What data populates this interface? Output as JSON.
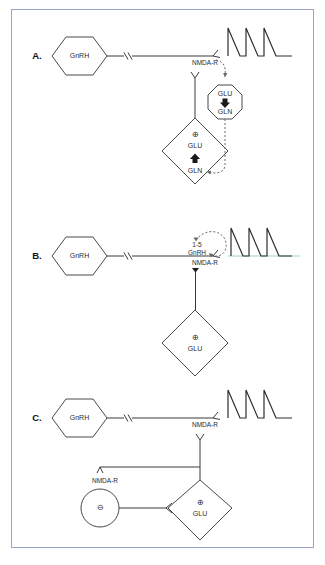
{
  "figure": {
    "border_color": "#9aa3c8",
    "background": "#ffffff",
    "line_color": "#3a3a3a",
    "dash_color": "#6a6a6a",
    "teal_accent": "#9fcfcb"
  },
  "panels": [
    {
      "letter": "A.",
      "cell_label": "GnRH",
      "receptor_label": "NMDA-R",
      "octagon": {
        "top_label": "GLU",
        "arrow": "down",
        "bottom_label": "GLN"
      },
      "diamond": {
        "sign": "⊕",
        "top_label": "GLU",
        "arrow": "up",
        "bottom_label": "GLN"
      },
      "pulses": 3
    },
    {
      "letter": "B.",
      "cell_label": "GnRH",
      "receptor_label": "NMDA-R",
      "loop_label_line1": "1-5",
      "loop_label_line2": "GnRH",
      "diamond": {
        "sign": "⊕",
        "label": "GLU"
      },
      "pulses": 3
    },
    {
      "letter": "C.",
      "cell_label": "GnRH",
      "receptor_label": "NMDA-R",
      "receptor_label_secondary": "NMDA-R",
      "interneuron": {
        "sign": "⊖"
      },
      "diamond": {
        "sign": "⊕",
        "label": "GLU"
      },
      "pulses": 3
    }
  ]
}
